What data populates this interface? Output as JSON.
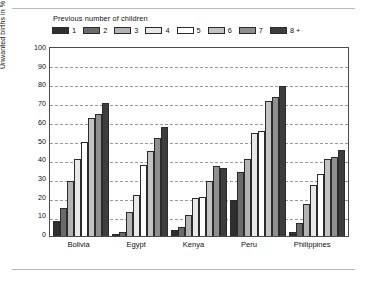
{
  "chart_data": {
    "type": "bar",
    "title": "",
    "legend_title": "Previous number of children",
    "legend_position": "top-left",
    "xlabel": "",
    "ylabel": "Unwanted births in %",
    "ylim": [
      0,
      100
    ],
    "ytick_labels": [
      "100",
      "90",
      "80",
      "70",
      "60",
      "50",
      "40",
      "30",
      "20",
      "10",
      "0"
    ],
    "grid": true,
    "categories": [
      "Bolivia",
      "Egypt",
      "Kenya",
      "Peru",
      "Philippines"
    ],
    "series": [
      {
        "name": "1",
        "color": "#2f2f2f",
        "values": [
          8,
          1,
          3,
          19,
          2
        ]
      },
      {
        "name": "2",
        "color": "#6b6b6b",
        "values": [
          15,
          2,
          5,
          34,
          7
        ]
      },
      {
        "name": "3",
        "color": "#b3b3b3",
        "values": [
          29,
          13,
          11,
          41,
          17
        ]
      },
      {
        "name": "4",
        "color": "#e8e8e8",
        "values": [
          41,
          22,
          20,
          55,
          27
        ]
      },
      {
        "name": "5",
        "color": "#ffffff",
        "values": [
          50,
          38,
          21,
          56,
          33
        ]
      },
      {
        "name": "6",
        "color": "#c2c2c2",
        "values": [
          63,
          45,
          29,
          72,
          41
        ]
      },
      {
        "name": "7",
        "color": "#8f8f8f",
        "values": [
          65,
          52,
          37,
          74,
          42
        ]
      },
      {
        "name": "8 +",
        "color": "#3d3d3d",
        "values": [
          71,
          58,
          36,
          80,
          46
        ]
      }
    ]
  }
}
